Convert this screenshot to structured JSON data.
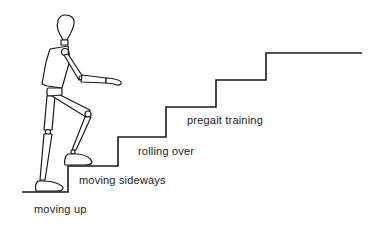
{
  "figure": {
    "type": "staircase-progression",
    "labels": [
      {
        "id": "moving-up",
        "text": "moving up"
      },
      {
        "id": "moving-sideways",
        "text": "moving sideways"
      },
      {
        "id": "rolling-over",
        "text": "rolling over"
      },
      {
        "id": "pregait-training",
        "text": "pregait training"
      }
    ],
    "figure_subject": "wooden-mannequin-climbing-stairs",
    "line_color": "#1a1a1a",
    "background": "#ffffff"
  }
}
